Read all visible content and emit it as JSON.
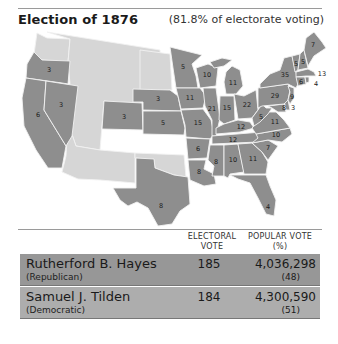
{
  "header": {
    "title": "Election of 1876",
    "subtitle": "(81.8% of electorate voting)"
  },
  "colors": {
    "state_fill": "#8e8e8e",
    "territory_fill": "#d6d6d6",
    "border": "#f2f2f2",
    "hayes_row": "#979797",
    "tilden_row": "#adadad"
  },
  "map": {
    "states": [
      {
        "name": "Oregon",
        "ev": "3"
      },
      {
        "name": "California",
        "ev": "6"
      },
      {
        "name": "Nevada",
        "ev": "3"
      },
      {
        "name": "Colorado",
        "ev": "3"
      },
      {
        "name": "Nebraska",
        "ev": "3"
      },
      {
        "name": "Kansas",
        "ev": "5"
      },
      {
        "name": "Texas",
        "ev": "8"
      },
      {
        "name": "Minnesota",
        "ev": "5"
      },
      {
        "name": "Iowa",
        "ev": "11"
      },
      {
        "name": "Missouri",
        "ev": "15"
      },
      {
        "name": "Arkansas",
        "ev": "6"
      },
      {
        "name": "Louisiana",
        "ev": "8"
      },
      {
        "name": "Wisconsin",
        "ev": "10"
      },
      {
        "name": "Illinois",
        "ev": "21"
      },
      {
        "name": "Michigan",
        "ev": "11"
      },
      {
        "name": "Indiana",
        "ev": "15"
      },
      {
        "name": "Ohio",
        "ev": "22"
      },
      {
        "name": "Kentucky",
        "ev": "12"
      },
      {
        "name": "Tennessee",
        "ev": "12"
      },
      {
        "name": "Mississippi",
        "ev": "8"
      },
      {
        "name": "Alabama",
        "ev": "10"
      },
      {
        "name": "Georgia",
        "ev": "11"
      },
      {
        "name": "Florida",
        "ev": "4"
      },
      {
        "name": "South Carolina",
        "ev": "7"
      },
      {
        "name": "North Carolina",
        "ev": "10"
      },
      {
        "name": "Virginia",
        "ev": "11"
      },
      {
        "name": "West Virginia",
        "ev": "5"
      },
      {
        "name": "Pennsylvania",
        "ev": "29"
      },
      {
        "name": "New York",
        "ev": "35"
      },
      {
        "name": "Vermont",
        "ev": "5"
      },
      {
        "name": "New Hampshire",
        "ev": "5"
      },
      {
        "name": "Maine",
        "ev": "7"
      },
      {
        "name": "Massachusetts",
        "ev": "13"
      },
      {
        "name": "Rhode Island",
        "ev": "4"
      },
      {
        "name": "Connecticut",
        "ev": "6"
      },
      {
        "name": "New Jersey",
        "ev": "9"
      },
      {
        "name": "Delaware",
        "ev": "3"
      },
      {
        "name": "Maryland",
        "ev": "8"
      }
    ]
  },
  "table": {
    "headers": {
      "electoral_line1": "ELECTORAL",
      "electoral_line2": "VOTE",
      "popular_line1": "POPULAR VOTE",
      "popular_line2": "(%)"
    },
    "rows": [
      {
        "candidate": "Rutherford B. Hayes",
        "party": "(Republican)",
        "electoral_vote": "185",
        "popular_vote": "4,036,298",
        "popular_pct": "(48)"
      },
      {
        "candidate": "Samuel J. Tilden",
        "party": "(Democratic)",
        "electoral_vote": "184",
        "popular_vote": "4,300,590",
        "popular_pct": "(51)"
      }
    ]
  }
}
